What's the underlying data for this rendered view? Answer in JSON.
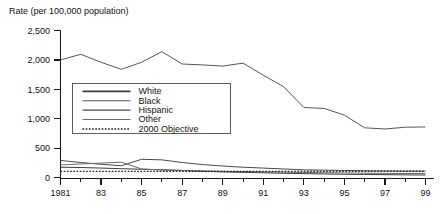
{
  "chart_data": {
    "type": "line",
    "title": "",
    "ylabel": "Rate (per 100,000 population)",
    "xlabel": "",
    "ylim": [
      0,
      2500
    ],
    "xlim": [
      1981,
      1999
    ],
    "grid": false,
    "legend_position": "inside-left",
    "y_ticks": [
      "0",
      "500",
      "1,000",
      "1,500",
      "2,000",
      "2,500"
    ],
    "y_tick_values": [
      0,
      500,
      1000,
      1500,
      2000,
      2500
    ],
    "x_ticks": [
      "1981",
      "83",
      "85",
      "87",
      "89",
      "91",
      "93",
      "95",
      "97",
      "99"
    ],
    "x_tick_values": [
      1981,
      1983,
      1985,
      1987,
      1989,
      1991,
      1993,
      1995,
      1997,
      1999
    ],
    "x": [
      1981,
      1982,
      1983,
      1984,
      1985,
      1986,
      1987,
      1988,
      1989,
      1990,
      1991,
      1992,
      1993,
      1994,
      1995,
      1996,
      1997,
      1998,
      1999
    ],
    "series": [
      {
        "name": "White",
        "style": "solid",
        "width": 1.0,
        "color": "#3b3b3b",
        "values": [
          175,
          170,
          160,
          150,
          140,
          130,
          120,
          105,
          95,
          88,
          80,
          72,
          66,
          60,
          56,
          52,
          48,
          45,
          42
        ]
      },
      {
        "name": "Black",
        "style": "solid",
        "width": 1.0,
        "color": "#555555",
        "values": [
          2000,
          2095,
          1960,
          1840,
          1960,
          2140,
          1930,
          1915,
          1895,
          1945,
          1740,
          1545,
          1190,
          1175,
          1060,
          845,
          825,
          855,
          860
        ]
      },
      {
        "name": "Hispanic",
        "style": "solid",
        "width": 1.0,
        "color": "#4a4a4a",
        "values": [
          290,
          255,
          225,
          200,
          310,
          300,
          255,
          220,
          195,
          175,
          160,
          145,
          130,
          125,
          120,
          115,
          112,
          110,
          110
        ]
      },
      {
        "name": "Other",
        "style": "solid",
        "width": 1.0,
        "color": "#6a6a6a",
        "values": [
          215,
          230,
          245,
          260,
          145,
          130,
          120,
          112,
          105,
          100,
          95,
          90,
          86,
          82,
          78,
          74,
          70,
          68,
          66
        ]
      },
      {
        "name": "2000 Objective",
        "style": "dotted",
        "width": 1.3,
        "color": "#1a1a1a",
        "values": [
          105,
          105,
          105,
          105,
          105,
          105,
          105,
          105,
          105,
          105,
          105,
          105,
          105,
          105,
          105,
          105,
          105,
          105,
          105
        ]
      }
    ],
    "legend_entries": [
      "White",
      "Black",
      "Hispanic",
      "Other",
      "2000 Objective"
    ]
  },
  "legend": {
    "items": [
      {
        "label": "White"
      },
      {
        "label": "Black"
      },
      {
        "label": "Hispanic"
      },
      {
        "label": "Other"
      },
      {
        "label": "2000 Objective"
      }
    ]
  }
}
